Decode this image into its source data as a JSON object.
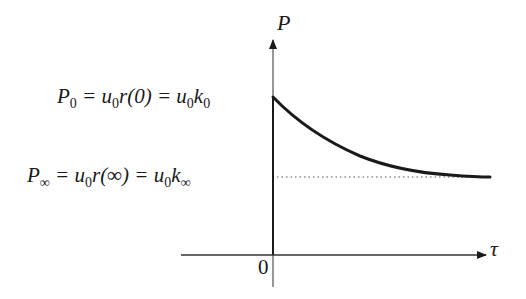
{
  "diagram": {
    "type": "exponential-decay-graph",
    "y_axis": {
      "label": "P"
    },
    "x_axis": {
      "label": "τ"
    },
    "origin_label": "0",
    "levels": [
      {
        "id": "initial",
        "parts": {
          "lhs": "P",
          "lhs_sub": "0",
          "eq1": " = u",
          "eq1_sub": "0",
          "mid": "r(0) = u",
          "mid_sub": "0",
          "rhs": "k",
          "rhs_sub": "0"
        },
        "full_text": "P_0 = u_0 r(0) = u_0 k_0"
      },
      {
        "id": "asymptote",
        "parts": {
          "lhs": "P",
          "lhs_sub": "∞",
          "eq1": " = u",
          "eq1_sub": "0",
          "mid": "r(∞) = u",
          "mid_sub": "0",
          "rhs": "k",
          "rhs_sub": "∞"
        },
        "full_text": "P_∞ = u_0 r(∞) = u_0 k_∞"
      }
    ],
    "curve": {
      "description": "Decreasing curve from P_0 at τ=0 approaching asymptote P_∞",
      "color": "#1a1a1a",
      "asymptote_style": "dotted"
    }
  }
}
